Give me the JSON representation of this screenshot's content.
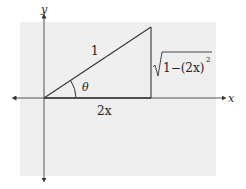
{
  "diagram": {
    "type": "right-triangle-on-axes",
    "background_color": "#efefef",
    "stroke_color": "#333333",
    "axes": {
      "x_label": "x",
      "y_label": "y"
    },
    "triangle": {
      "hypotenuse_label": "1",
      "base_label": "2x",
      "angle_label": "θ",
      "height_label": {
        "radicand": "1−(2x)",
        "exponent": "2"
      }
    }
  }
}
